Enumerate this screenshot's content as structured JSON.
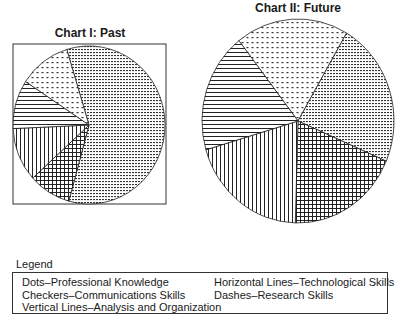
{
  "chart_data": [
    {
      "type": "pie",
      "title": "Chart I: Past",
      "categories": [
        "Dashes–Research Skills",
        "Checkers–Communications Skills",
        "Vertical Lines–Analysis and Organization",
        "Horizontal Lines–Technological Skills",
        "Dots–Professional Knowledge"
      ],
      "values": [
        59,
        9,
        11,
        10,
        11
      ],
      "patterns": [
        "dashes",
        "checkers",
        "vertical",
        "horizontal",
        "dots"
      ],
      "start_angle_deg": -17,
      "boxed": true
    },
    {
      "type": "pie",
      "title": "Chart II: Future",
      "categories": [
        "Dots–Professional Knowledge",
        "Dashes–Research Skills",
        "Checkers–Communications Skills",
        "Vertical Lines–Analysis and Organization",
        "Horizontal Lines–Technological Skills"
      ],
      "values": [
        19,
        23,
        19,
        20,
        19
      ],
      "patterns": [
        "dots",
        "dashes",
        "checkers",
        "vertical",
        "horizontal"
      ],
      "start_angle_deg": -38,
      "boxed": false
    }
  ],
  "charts": {
    "past_title": "Chart I: Past",
    "future_title": "Chart II: Future"
  },
  "legend": {
    "label": "Legend",
    "items": [
      "Dots–Professional Knowledge",
      "Checkers–Communications Skills",
      "Vertical Lines–Analysis and Organization",
      "Horizontal Lines–Technological Skills",
      "Dashes–Research Skills"
    ]
  },
  "colors": {
    "ink": "#1a1a1a",
    "background": "#ffffff"
  }
}
